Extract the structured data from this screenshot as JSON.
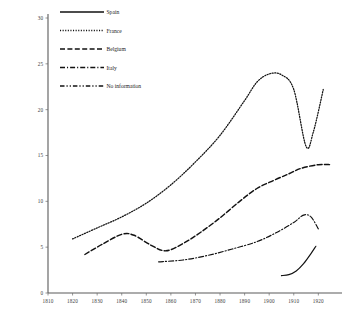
{
  "chart_data": {
    "type": "line",
    "title": "",
    "subtitle": "",
    "xlabel": "",
    "ylabel": "",
    "xlim": [
      1810,
      1928
    ],
    "ylim": [
      0,
      30
    ],
    "grid": false,
    "legend_position": "top-left",
    "xticks": [
      "1810",
      "1820",
      "1830",
      "1840",
      "1850",
      "1860",
      "1870",
      "1880",
      "1890",
      "1900",
      "1910",
      "1920"
    ],
    "yticks": [
      "0",
      "5",
      "10",
      "15",
      "20",
      "25",
      "30"
    ],
    "series": [
      {
        "name": "Spain",
        "style": "solid",
        "color": "#111111",
        "x": [
          1905,
          1908,
          1911,
          1914,
          1917,
          1919
        ],
        "values": [
          1.9,
          2.0,
          2.4,
          3.2,
          4.3,
          5.1
        ]
      },
      {
        "name": "France",
        "style": "dotted",
        "color": "#111111",
        "x": [
          1820,
          1830,
          1840,
          1850,
          1860,
          1870,
          1880,
          1890,
          1895,
          1900,
          1905,
          1910,
          1915,
          1918,
          1922
        ],
        "values": [
          5.9,
          7.1,
          8.3,
          9.8,
          11.8,
          14.3,
          17.2,
          21.0,
          23.0,
          23.9,
          23.8,
          22.2,
          16.0,
          17.6,
          22.2
        ]
      },
      {
        "name": "Belgium",
        "style": "dashed",
        "color": "#111111",
        "x": [
          1825,
          1832,
          1840,
          1845,
          1852,
          1858,
          1865,
          1872,
          1880,
          1888,
          1895,
          1902,
          1908,
          1913,
          1920,
          1925
        ],
        "values": [
          4.2,
          5.3,
          6.4,
          6.3,
          5.2,
          4.6,
          5.4,
          6.6,
          8.2,
          10.0,
          11.4,
          12.3,
          13.0,
          13.6,
          14.0,
          14.0
        ]
      },
      {
        "name": "Italy",
        "style": "dashdot",
        "color": "#111111",
        "x": [
          1855,
          1865,
          1875,
          1885,
          1895,
          1903,
          1910,
          1914,
          1917,
          1920
        ],
        "values": [
          3.4,
          3.6,
          4.1,
          4.8,
          5.6,
          6.6,
          7.7,
          8.5,
          8.3,
          7.0
        ]
      },
      {
        "name": "No information",
        "style": "longdashdot",
        "color": "#111111",
        "x": [],
        "values": []
      }
    ],
    "legend": [
      {
        "label": "Spain",
        "style": "solid"
      },
      {
        "label": "France",
        "style": "dotted"
      },
      {
        "label": "Belgium",
        "style": "dashed"
      },
      {
        "label": "Italy",
        "style": "dashdot"
      },
      {
        "label": "No information",
        "style": "longdashdot"
      }
    ]
  }
}
